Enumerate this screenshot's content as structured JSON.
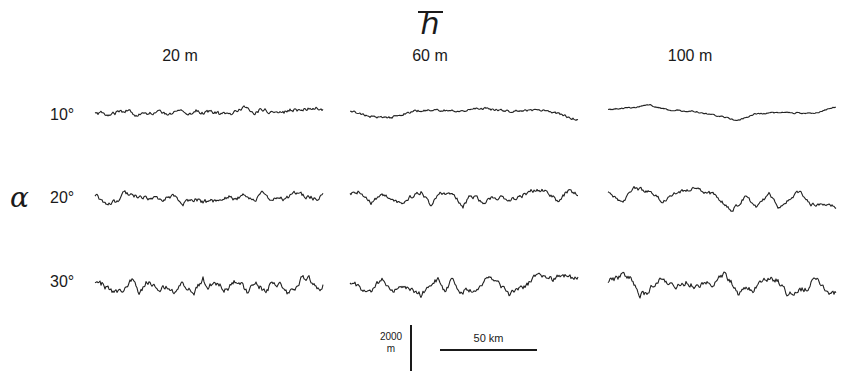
{
  "figure": {
    "title_symbol": "h",
    "title_overbar": true,
    "column_axis": "h̄ (mean height)",
    "row_axis_symbol": "α",
    "columns": [
      {
        "label": "20 m",
        "x": 95
      },
      {
        "label": "60 m",
        "x": 350
      },
      {
        "label": "100 m",
        "x": 608
      }
    ],
    "rows": [
      {
        "label": "10°",
        "y": 115
      },
      {
        "label": "20°",
        "y": 199
      },
      {
        "label": "30°",
        "y": 286
      }
    ],
    "scale_bars": {
      "vertical": {
        "value": "2000",
        "unit": "m"
      },
      "horizontal": {
        "label": "50 km"
      }
    }
  },
  "panels": [
    {
      "col": 0,
      "row": 0,
      "amplitude": 4,
      "wavelength": 9,
      "roughness": 0.8,
      "trend": -6,
      "seed": 11
    },
    {
      "col": 1,
      "row": 0,
      "amplitude": 8,
      "wavelength": 20,
      "roughness": 0.5,
      "trend": 0,
      "seed": 23
    },
    {
      "col": 2,
      "row": 0,
      "amplitude": 11,
      "wavelength": 24,
      "roughness": 0.3,
      "trend": 0,
      "seed": 37
    },
    {
      "col": 0,
      "row": 1,
      "amplitude": 6,
      "wavelength": 10,
      "roughness": 1.0,
      "trend": -4,
      "seed": 41
    },
    {
      "col": 1,
      "row": 1,
      "amplitude": 9,
      "wavelength": 12,
      "roughness": 0.9,
      "trend": 0,
      "seed": 53
    },
    {
      "col": 2,
      "row": 1,
      "amplitude": 12,
      "wavelength": 16,
      "roughness": 0.8,
      "trend": 0,
      "seed": 67
    },
    {
      "col": 0,
      "row": 2,
      "amplitude": 9,
      "wavelength": 7,
      "roughness": 1.3,
      "trend": 0,
      "seed": 71
    },
    {
      "col": 1,
      "row": 2,
      "amplitude": 10,
      "wavelength": 9,
      "roughness": 1.2,
      "trend": 0,
      "seed": 83
    },
    {
      "col": 2,
      "row": 2,
      "amplitude": 12,
      "wavelength": 10,
      "roughness": 1.2,
      "trend": 0,
      "seed": 97
    }
  ],
  "panel_width": 228
}
